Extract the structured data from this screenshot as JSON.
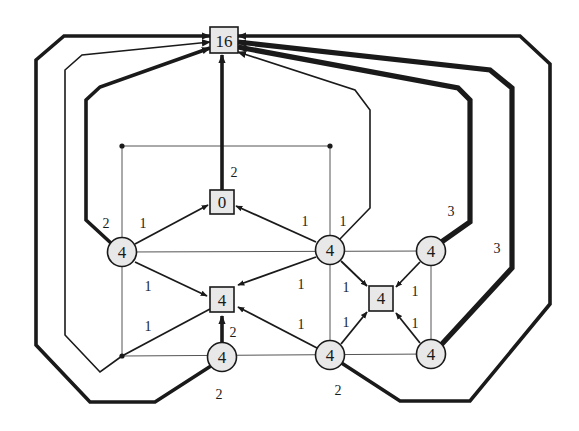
{
  "diagram": {
    "type": "flow-network",
    "sink": {
      "id": "sink",
      "label": "16",
      "shape": "square"
    },
    "nodes": [
      {
        "id": "sq0",
        "label": "0",
        "shape": "square"
      },
      {
        "id": "sqL",
        "label": "4",
        "shape": "square"
      },
      {
        "id": "sqR",
        "label": "4",
        "shape": "square"
      },
      {
        "id": "cA",
        "label": "4",
        "shape": "circle"
      },
      {
        "id": "cB",
        "label": "4",
        "shape": "circle"
      },
      {
        "id": "cC",
        "label": "4",
        "shape": "circle"
      },
      {
        "id": "cD",
        "label": "4",
        "shape": "circle"
      },
      {
        "id": "cE",
        "label": "4",
        "shape": "circle"
      },
      {
        "id": "cF",
        "label": "4",
        "shape": "circle"
      }
    ],
    "edge_labels": {
      "sq0_to_sink": "2",
      "cA_to_sink": "2",
      "cA_to_sq0": "1",
      "cB_to_sq0": "1",
      "cB_to_sink": "1",
      "cC_to_sink": "3",
      "cF_to_sink": "3",
      "cA_to_sqL": "1",
      "dot_to_sqL": "1",
      "cD_to_sqL": "2",
      "cB_to_sqL": "1",
      "cE_to_sqL": "1",
      "cB_to_sqR": "1",
      "cE_to_sqR": "1",
      "cC_to_sqR": "1",
      "cF_to_sqR": "1",
      "cD_to_sink": "2",
      "cE_to_sink": "2"
    }
  }
}
